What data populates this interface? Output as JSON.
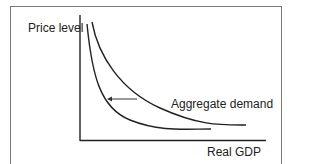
{
  "diagram": {
    "y_axis_label": "Price level",
    "x_axis_label": "Real GDP",
    "curve_label": "Aggregate demand",
    "curves": [
      {
        "name": "aggregate-demand-original",
        "description": "outer curve (right)"
      },
      {
        "name": "aggregate-demand-shifted",
        "description": "inner curve (left)"
      }
    ],
    "arrow": {
      "direction": "left",
      "meaning": "leftward shift of aggregate demand"
    },
    "colors": {
      "line": "#222222",
      "frame": "#7a7a7a",
      "background": "#ffffff"
    }
  }
}
